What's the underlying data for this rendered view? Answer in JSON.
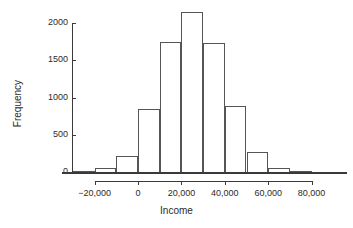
{
  "chart_data": {
    "type": "bar",
    "title": "",
    "subtitle": "",
    "xlabel": "Income",
    "ylabel": "Frequency",
    "xlim": [
      -33000,
      85000
    ],
    "ylim": [
      0,
      2200
    ],
    "grid": false,
    "legend": null,
    "bin_width": 10000,
    "x_tick_values": [
      -20000,
      0,
      20000,
      40000,
      60000,
      80000
    ],
    "x_tick_labels": [
      "−20,000",
      "0",
      "20,000",
      "40,000",
      "60,000",
      "80,000"
    ],
    "y_tick_values": [
      0,
      500,
      1000,
      1500,
      2000
    ],
    "y_tick_labels": [
      "0",
      "500",
      "1000",
      "1500",
      "2000"
    ],
    "bins": [
      {
        "left": -30000,
        "right": -20000,
        "label": "−30,000 to −20,000",
        "value": 15
      },
      {
        "left": -20000,
        "right": -10000,
        "label": "−20,000 to −10,000",
        "value": 60
      },
      {
        "left": -10000,
        "right": 0,
        "label": "−10,000 to 0",
        "value": 210
      },
      {
        "left": 0,
        "right": 10000,
        "label": "0 to 10,000",
        "value": 840
      },
      {
        "left": 10000,
        "right": 20000,
        "label": "10,000 to 20,000",
        "value": 1740
      },
      {
        "left": 20000,
        "right": 30000,
        "label": "20,000 to 30,000",
        "value": 2150
      },
      {
        "left": 30000,
        "right": 40000,
        "label": "30,000 to 40,000",
        "value": 1730
      },
      {
        "left": 40000,
        "right": 50000,
        "label": "40,000 to 50,000",
        "value": 880
      },
      {
        "left": 50000,
        "right": 60000,
        "label": "50,000 to 60,000",
        "value": 275
      },
      {
        "left": 60000,
        "right": 70000,
        "label": "60,000 to 70,000",
        "value": 55
      },
      {
        "left": 70000,
        "right": 80000,
        "label": "70,000 to 80,000",
        "value": 10
      }
    ],
    "categories": [
      "-30,000",
      "-20,000",
      "-10,000",
      "0",
      "10,000",
      "20,000",
      "30,000",
      "40,000",
      "50,000",
      "60,000",
      "70,000"
    ],
    "values": [
      15,
      60,
      210,
      840,
      1740,
      2150,
      1730,
      880,
      275,
      55,
      10
    ]
  },
  "style": {
    "line_color": "#555555",
    "axis_color": "#3a3a3a",
    "background": "#ffffff"
  }
}
